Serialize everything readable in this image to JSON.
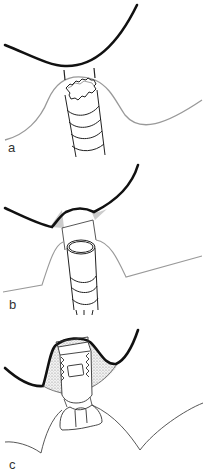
{
  "figure": {
    "panels": [
      {
        "id": "a",
        "label": "a",
        "description": "Implant with hexagonal connection below gingival contour, unattached to crown outline"
      },
      {
        "id": "b",
        "label": "b",
        "description": "Cylindrical implant with abutment connecting to crown; shaded cement areas at margins"
      },
      {
        "id": "c",
        "label": "c",
        "description": "Threaded abutment inside crown with stippled cement/material filling; implant head with internal socket"
      }
    ]
  },
  "colors": {
    "crown_outline": "#111111",
    "gingiva_line": "#999999",
    "implant_line": "#222222",
    "cement_fill": "#cccccc",
    "stipple_fill": "#d9d9d9"
  }
}
